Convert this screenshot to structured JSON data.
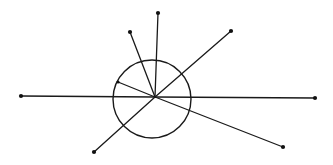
{
  "diagram": {
    "title": "",
    "canvas": {
      "width": 333,
      "height": 165,
      "background": "#ffffff"
    },
    "stroke_color": "#1a1a1a",
    "center": {
      "x": 155,
      "y": 97
    },
    "circle": {
      "cx": 152,
      "cy": 99,
      "r": 39
    },
    "spokes": [
      {
        "id": "left",
        "x": 21,
        "y": 96,
        "endpoint": "dot"
      },
      {
        "id": "right",
        "x": 315,
        "y": 98,
        "endpoint": "dot"
      },
      {
        "id": "top",
        "x": 158,
        "y": 13,
        "endpoint": "dot"
      },
      {
        "id": "upper-left",
        "x": 130,
        "y": 32,
        "endpoint": "dot"
      },
      {
        "id": "upper-right",
        "x": 231,
        "y": 31,
        "endpoint": "dot"
      },
      {
        "id": "lower-left",
        "x": 94,
        "y": 152,
        "endpoint": "dot"
      },
      {
        "id": "lower-right",
        "x": 283,
        "y": 147,
        "endpoint": "dot"
      },
      {
        "id": "short-left",
        "x": 118,
        "y": 82,
        "endpoint": "dot-on-circle"
      }
    ]
  }
}
